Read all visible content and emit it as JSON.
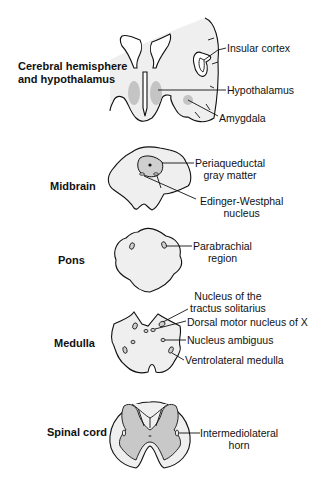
{
  "diagram": {
    "type": "neuroanatomy-cross-sections",
    "sections": [
      {
        "name": "Cerebral hemisphere and hypothalamus",
        "title_line1": "Cerebral hemisphere",
        "title_line2": "and hypothalamus",
        "labels": [
          "Insular cortex",
          "Hypothalamus",
          "Amygdala"
        ]
      },
      {
        "name": "Midbrain",
        "title": "Midbrain",
        "labels": [
          {
            "line1": "Periaqueductal",
            "line2": "gray matter"
          },
          {
            "line1": "Edinger-Westphal",
            "line2": "nucleus"
          }
        ]
      },
      {
        "name": "Pons",
        "title": "Pons",
        "labels": [
          {
            "line1": "Parabrachial",
            "line2": "region"
          }
        ]
      },
      {
        "name": "Medulla",
        "title": "Medulla",
        "labels": [
          {
            "line1": "Nucleus of the",
            "line2": "tractus solitarius"
          },
          "Dorsal motor nucleus of X",
          "Nucleus ambiguus",
          "Ventrolateral medulla"
        ]
      },
      {
        "name": "Spinal cord",
        "title": "Spinal cord",
        "labels": [
          {
            "line1": "Intermediolateral",
            "line2": "horn"
          }
        ]
      }
    ],
    "colors": {
      "section_fill": "#efefef",
      "gray_matter": "#c8c8c8",
      "highlight": "#b9b9b9",
      "outline": "#111111"
    }
  }
}
